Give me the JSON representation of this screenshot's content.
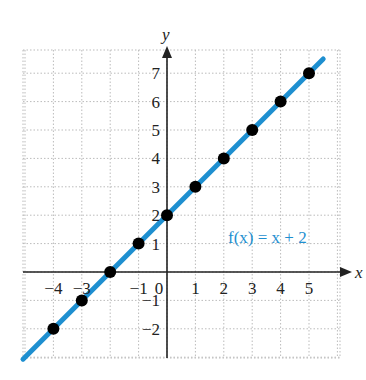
{
  "chart_data": {
    "type": "scatter",
    "title": "",
    "xlabel": "x",
    "ylabel": "y",
    "xlim": [
      -5,
      6
    ],
    "ylim": [
      -3,
      8
    ],
    "grid": true,
    "x_ticks": [
      -4,
      -3,
      -1,
      0,
      1,
      2,
      3,
      4,
      5
    ],
    "y_ticks": [
      -2,
      -1,
      1,
      2,
      3,
      4,
      5,
      6,
      7
    ],
    "series": [
      {
        "name": "points",
        "x": [
          -4,
          -3,
          -2,
          -1,
          0,
          1,
          2,
          3,
          4,
          5
        ],
        "y": [
          -2,
          -1,
          0,
          1,
          2,
          3,
          4,
          5,
          6,
          7
        ]
      },
      {
        "name": "f(x) = x + 2",
        "type": "line",
        "x": [
          -5,
          5.5
        ],
        "y": [
          -3,
          7.5
        ],
        "color": "#1e8fd0"
      }
    ],
    "annotations": [
      {
        "text": "f(x) = x + 2",
        "x": 2.2,
        "y": 1.5,
        "color": "#1e8fd0"
      }
    ]
  },
  "labels": {
    "x_axis": "x",
    "y_axis": "y",
    "function": "f(x) = x + 2",
    "origin": "0",
    "x_tick_labels": [
      "−4",
      "−3",
      "−1",
      "1",
      "2",
      "3",
      "4",
      "5"
    ],
    "y_tick_labels": [
      "7",
      "6",
      "5",
      "4",
      "3",
      "2",
      "1",
      "−1",
      "−2"
    ]
  },
  "colors": {
    "line": "#1e8fd0",
    "points": "#000000",
    "grid": "#bbbbbb",
    "axis": "#222222"
  }
}
